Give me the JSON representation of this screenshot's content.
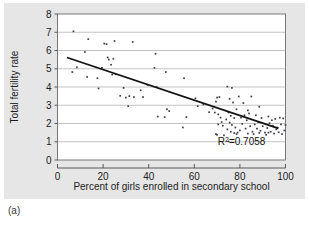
{
  "figure": {
    "caption": "(a)",
    "background_color": "#e6e6e6",
    "plot_background_color": "#ffffff"
  },
  "chart_data": {
    "type": "scatter",
    "title": "",
    "xlabel": "Percent of girls enrolled in secondary school",
    "ylabel": "Total fertility rate",
    "xlim": [
      0,
      100
    ],
    "ylim": [
      0,
      8
    ],
    "xticks": [
      0,
      20,
      40,
      60,
      80,
      100
    ],
    "yticks": [
      0,
      1,
      2,
      3,
      4,
      5,
      6,
      7,
      8
    ],
    "grid": "horizontal",
    "legend": "none",
    "annotations": [
      {
        "text": "R2=0.7058",
        "display_text": "R",
        "superscript": "2",
        "suffix": "=0.7058",
        "x": 78,
        "y": 0.82
      }
    ],
    "trendline": {
      "type": "linear",
      "r_squared": 0.7058,
      "x_start": 4.5,
      "y_start": 5.6,
      "x_end": 96.5,
      "y_end": 1.75,
      "color": "#111111"
    },
    "marker": {
      "shape": "square",
      "size": 1.7,
      "color": "#3c3c46"
    },
    "points": [
      [
        7.0,
        7.05
      ],
      [
        6.5,
        4.82
      ],
      [
        8.5,
        5.08
      ],
      [
        13.5,
        6.62
      ],
      [
        12.0,
        5.92
      ],
      [
        13.0,
        4.55
      ],
      [
        20.5,
        6.38
      ],
      [
        21.5,
        6.35
      ],
      [
        25.0,
        6.52
      ],
      [
        22.0,
        5.62
      ],
      [
        22.5,
        5.5
      ],
      [
        24.5,
        5.55
      ],
      [
        23.5,
        5.22
      ],
      [
        25.5,
        4.7
      ],
      [
        24.0,
        4.68
      ],
      [
        19.5,
        5.05
      ],
      [
        18.0,
        3.92
      ],
      [
        17.5,
        4.48
      ],
      [
        33.0,
        6.47
      ],
      [
        43.0,
        5.82
      ],
      [
        42.5,
        5.05
      ],
      [
        47.5,
        4.82
      ],
      [
        55.5,
        4.48
      ],
      [
        29.0,
        3.95
      ],
      [
        31.5,
        3.5
      ],
      [
        30.0,
        3.42
      ],
      [
        27.5,
        3.52
      ],
      [
        33.5,
        3.45
      ],
      [
        36.5,
        3.82
      ],
      [
        37.5,
        3.45
      ],
      [
        31.0,
        2.95
      ],
      [
        39.5,
        4.12
      ],
      [
        43.5,
        4.0
      ],
      [
        48.0,
        2.78
      ],
      [
        49.0,
        2.68
      ],
      [
        44.0,
        2.38
      ],
      [
        47.0,
        2.35
      ],
      [
        56.5,
        2.35
      ],
      [
        55.0,
        1.78
      ],
      [
        60.5,
        3.38
      ],
      [
        61.5,
        2.95
      ],
      [
        64.0,
        3.05
      ],
      [
        66.5,
        2.62
      ],
      [
        68.0,
        2.82
      ],
      [
        69.5,
        3.2
      ],
      [
        70.0,
        3.42
      ],
      [
        71.0,
        3.45
      ],
      [
        69.0,
        2.6
      ],
      [
        70.5,
        2.5
      ],
      [
        71.5,
        2.32
      ],
      [
        72.0,
        2.08
      ],
      [
        70.5,
        1.95
      ],
      [
        69.5,
        1.42
      ],
      [
        70.0,
        1.38
      ],
      [
        73.0,
        1.35
      ],
      [
        74.5,
        4.02
      ],
      [
        76.5,
        3.95
      ],
      [
        75.5,
        3.35
      ],
      [
        77.0,
        3.15
      ],
      [
        78.5,
        2.78
      ],
      [
        75.0,
        2.6
      ],
      [
        76.0,
        2.42
      ],
      [
        77.5,
        2.3
      ],
      [
        74.0,
        2.22
      ],
      [
        75.5,
        2.05
      ],
      [
        76.5,
        1.92
      ],
      [
        78.0,
        1.78
      ],
      [
        74.5,
        1.68
      ],
      [
        76.0,
        1.55
      ],
      [
        77.5,
        1.48
      ],
      [
        78.5,
        1.42
      ],
      [
        75.0,
        1.02
      ],
      [
        79.5,
        3.48
      ],
      [
        81.5,
        3.12
      ],
      [
        83.5,
        2.72
      ],
      [
        85.0,
        3.48
      ],
      [
        84.0,
        2.55
      ],
      [
        82.0,
        2.45
      ],
      [
        80.5,
        2.32
      ],
      [
        83.0,
        2.18
      ],
      [
        81.0,
        1.98
      ],
      [
        84.5,
        1.85
      ],
      [
        82.5,
        1.72
      ],
      [
        80.0,
        1.62
      ],
      [
        85.5,
        1.55
      ],
      [
        83.5,
        1.45
      ],
      [
        88.5,
        2.92
      ],
      [
        87.0,
        2.45
      ],
      [
        89.5,
        2.3
      ],
      [
        88.0,
        2.08
      ],
      [
        86.5,
        1.95
      ],
      [
        90.0,
        1.85
      ],
      [
        87.5,
        1.72
      ],
      [
        89.0,
        1.6
      ],
      [
        91.0,
        1.5
      ],
      [
        86.0,
        1.42
      ],
      [
        92.5,
        2.38
      ],
      [
        94.0,
        2.18
      ],
      [
        93.0,
        2.02
      ],
      [
        95.5,
        2.25
      ],
      [
        94.5,
        1.88
      ],
      [
        92.0,
        1.75
      ],
      [
        96.0,
        1.68
      ],
      [
        93.5,
        1.55
      ],
      [
        95.0,
        1.45
      ],
      [
        91.5,
        1.38
      ],
      [
        97.5,
        2.32
      ],
      [
        99.0,
        2.28
      ],
      [
        98.0,
        1.95
      ],
      [
        100.0,
        1.92
      ],
      [
        99.5,
        1.62
      ],
      [
        97.0,
        1.52
      ],
      [
        98.5,
        1.42
      ],
      [
        100.5,
        1.42
      ],
      [
        96.5,
        1.78
      ],
      [
        92.5,
        1.5
      ],
      [
        88.5,
        1.48
      ],
      [
        79.0,
        1.5
      ],
      [
        72.5,
        1.88
      ]
    ]
  }
}
